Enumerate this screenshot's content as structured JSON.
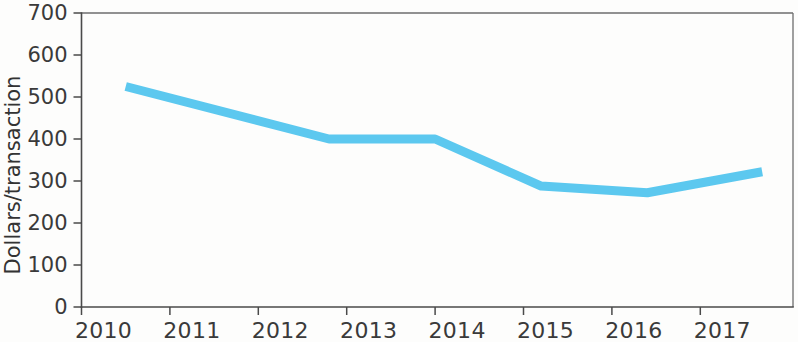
{
  "chart_data": {
    "type": "line",
    "title": "",
    "subtitle": "",
    "xlabel": "",
    "ylabel": "Dollars/transaction",
    "x": [
      2010,
      2011,
      2012,
      2013,
      2014,
      2015,
      2016,
      2017
    ],
    "categories": [
      "2010",
      "2011",
      "2012",
      "2013",
      "2014",
      "2015",
      "2016",
      "2017"
    ],
    "values": [
      525,
      462,
      400,
      400,
      340,
      288,
      272,
      322
    ],
    "series": [
      {
        "name": "Dollars per transaction",
        "values": [
          525,
          462,
          400,
          400,
          340,
          288,
          272,
          322
        ]
      }
    ],
    "vertices": [
      {
        "x": 2010.5,
        "y": 525
      },
      {
        "x": 2012.8,
        "y": 400
      },
      {
        "x": 2014.0,
        "y": 400
      },
      {
        "x": 2015.2,
        "y": 288
      },
      {
        "x": 2016.4,
        "y": 272
      },
      {
        "x": 2017.7,
        "y": 322
      }
    ],
    "ylim": [
      0,
      700
    ],
    "ytick_values": [
      0,
      100,
      200,
      300,
      400,
      500,
      600,
      700
    ],
    "ytick_labels": [
      "0",
      "100",
      "200",
      "300",
      "400",
      "500",
      "600",
      "700"
    ],
    "xtick_labels": [
      "2010",
      "2011",
      "2012",
      "2013",
      "2014",
      "2015",
      "2016",
      "2017"
    ],
    "grid": false,
    "legend": null,
    "legend_position": "none",
    "line_color": "#5cc8ef",
    "line_width": 9,
    "axis_color": "#4a4a4a",
    "frame_color": "#6e6e6e",
    "background_color": "#fdfdfc"
  }
}
